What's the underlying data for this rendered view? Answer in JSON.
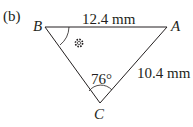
{
  "figure": {
    "label": "(b)",
    "vertices": {
      "A": {
        "name": "A",
        "x": 167,
        "y": 27
      },
      "B": {
        "name": "B",
        "x": 45,
        "y": 27
      },
      "C": {
        "name": "C",
        "x": 100,
        "y": 103
      }
    },
    "sides": {
      "BA": {
        "label": "12.4 mm"
      },
      "AC": {
        "label": "10.4 mm"
      }
    },
    "angles": {
      "C": {
        "label": "76°"
      },
      "B": {
        "label": "unknown-angle-marker"
      }
    },
    "colors": {
      "line": "#231f20",
      "text": "#231f20"
    }
  }
}
